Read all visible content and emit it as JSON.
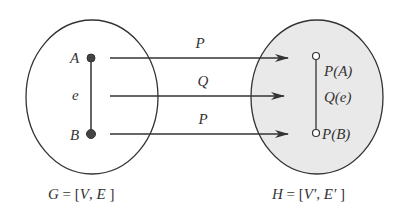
{
  "colors": {
    "stroke": "#333333",
    "left_fill": "#ffffff",
    "right_fill": "#e9e9e9",
    "node_filled": "#444444",
    "node_open": "#ffffff"
  },
  "graph_g": {
    "caption_var": "G",
    "caption_eq": " = [",
    "caption_v": "V",
    "caption_sep": ", ",
    "caption_e": "E",
    "caption_end": " ]",
    "vertex_a": "A",
    "edge_e": "e",
    "vertex_b": "B"
  },
  "graph_h": {
    "caption_var": "H",
    "caption_eq": " = [",
    "caption_v": "V′",
    "caption_sep": ", ",
    "caption_e": "E′",
    "caption_end": " ]",
    "vertex_pa": "P(A)",
    "edge_qe": "Q(e)",
    "vertex_pb": "P(B)"
  },
  "mappings": [
    {
      "label": "P",
      "from": "A",
      "to": "P(A)"
    },
    {
      "label": "Q",
      "from": "e",
      "to": "Q(e)"
    },
    {
      "label": "P",
      "from": "B",
      "to": "P(B)"
    }
  ]
}
